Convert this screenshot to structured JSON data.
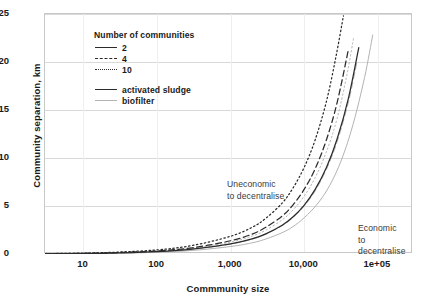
{
  "chart_data": {
    "type": "line",
    "title": "",
    "xlabel": "Commmunity size",
    "ylabel": "Community separation, km",
    "xscale": "log",
    "xlim": [
      3,
      300000
    ],
    "ylim": [
      0,
      25
    ],
    "ytick_labels": [
      "0",
      "5",
      "10",
      "15",
      "20",
      "25"
    ],
    "ytick_values": [
      0,
      5,
      10,
      15,
      20,
      25
    ],
    "xtick_labels": [
      "10",
      "100",
      "1,000",
      "10,000",
      "1e+05"
    ],
    "xtick_values": [
      10,
      100,
      1000,
      10000,
      100000
    ],
    "grid": "horizontal",
    "legend_position": "upper-left",
    "legend_title": "Number of communities",
    "annotations": [
      {
        "name": "uneconomic",
        "text": "Uneconomic\nto decentralise"
      },
      {
        "name": "economic",
        "text": "Economic\nto decentralise"
      }
    ],
    "series": [
      {
        "name": "activated sludge, 2 communities",
        "process": "activated sludge",
        "communities": 2,
        "color": "#2b2b2b",
        "dash": "solid",
        "x": [
          3,
          10,
          30,
          100,
          300,
          1000,
          2000,
          3000,
          5000,
          7000,
          10000,
          14000,
          20000,
          28000,
          40000,
          55000
        ],
        "y": [
          0.02,
          0.05,
          0.11,
          0.24,
          0.5,
          1.05,
          1.6,
          2.1,
          3.0,
          3.85,
          5.1,
          6.7,
          9.0,
          12.0,
          16.3,
          21.5
        ]
      },
      {
        "name": "activated sludge, 4 communities",
        "process": "activated sludge",
        "communities": 4,
        "color": "#2b2b2b",
        "dash": "dashed",
        "x": [
          3,
          10,
          30,
          100,
          300,
          1000,
          2000,
          3000,
          5000,
          7000,
          10000,
          14000,
          20000,
          28000,
          40000
        ],
        "y": [
          0.03,
          0.07,
          0.15,
          0.32,
          0.65,
          1.38,
          2.1,
          2.78,
          3.95,
          5.1,
          6.75,
          8.85,
          11.9,
          15.8,
          21.4
        ]
      },
      {
        "name": "activated sludge, 10 communities",
        "process": "activated sludge",
        "communities": 10,
        "color": "#2b2b2b",
        "dash": "dotted",
        "x": [
          3,
          10,
          30,
          100,
          300,
          1000,
          2000,
          3000,
          5000,
          7000,
          10000,
          14000,
          20000,
          27000,
          34000
        ],
        "y": [
          0.04,
          0.09,
          0.2,
          0.43,
          0.88,
          1.85,
          2.82,
          3.72,
          5.3,
          6.85,
          9.05,
          11.85,
          15.9,
          20.6,
          24.8
        ]
      },
      {
        "name": "biofilter, 2 communities",
        "process": "biofilter",
        "communities": 2,
        "color": "#b3b3b3",
        "dash": "solid",
        "x": [
          3,
          10,
          30,
          100,
          300,
          1000,
          2000,
          3000,
          5000,
          7000,
          10000,
          15000,
          22000,
          32000,
          46000,
          66000,
          85000
        ],
        "y": [
          0.015,
          0.04,
          0.085,
          0.18,
          0.37,
          0.78,
          1.18,
          1.56,
          2.22,
          2.85,
          3.78,
          5.2,
          7.1,
          9.8,
          13.5,
          18.4,
          22.8
        ]
      },
      {
        "name": "biofilter, 4 communities",
        "process": "biofilter",
        "communities": 4,
        "color": "#b3b3b3",
        "dash": "dashed",
        "x": [
          3,
          10,
          30,
          100,
          300,
          1000,
          2000,
          3000,
          5000,
          7000,
          10000,
          14000,
          20000,
          28000,
          40000,
          52000
        ],
        "y": [
          0.02,
          0.05,
          0.11,
          0.24,
          0.49,
          1.03,
          1.57,
          2.06,
          2.94,
          3.78,
          5.0,
          6.55,
          8.82,
          11.7,
          15.9,
          20.0
        ]
      },
      {
        "name": "biofilter, 10 communities",
        "process": "biofilter",
        "communities": 10,
        "color": "#b3b3b3",
        "dash": "dotted",
        "x": [
          3,
          10,
          30,
          100,
          300,
          1000,
          2000,
          3000,
          5000,
          7000,
          10000,
          14000,
          20000,
          28000,
          38000,
          47000
        ],
        "y": [
          0.025,
          0.06,
          0.135,
          0.29,
          0.59,
          1.24,
          1.89,
          2.49,
          3.55,
          4.57,
          6.05,
          7.93,
          10.65,
          14.15,
          18.7,
          22.6
        ]
      }
    ]
  },
  "legend": {
    "title": "Number of communities",
    "count_entries": [
      {
        "label": "2",
        "style": "solid"
      },
      {
        "label": "4",
        "style": "dashed"
      },
      {
        "label": "10",
        "style": "dotted"
      }
    ],
    "process_entries": [
      {
        "label": "activated sludge",
        "style": "solid-dark"
      },
      {
        "label": "biofilter",
        "style": "solid-gray"
      }
    ]
  },
  "annotations": {
    "uneconomic": "Uneconomic\nto decentralise",
    "economic": "Economic\nto decentralise"
  },
  "colors": {
    "activated_sludge": "#2b2b2b",
    "biofilter": "#b3b3b3",
    "frame": "#c8c8c8",
    "gridline": "#d9d9d9",
    "text": "#1a1a1a"
  }
}
